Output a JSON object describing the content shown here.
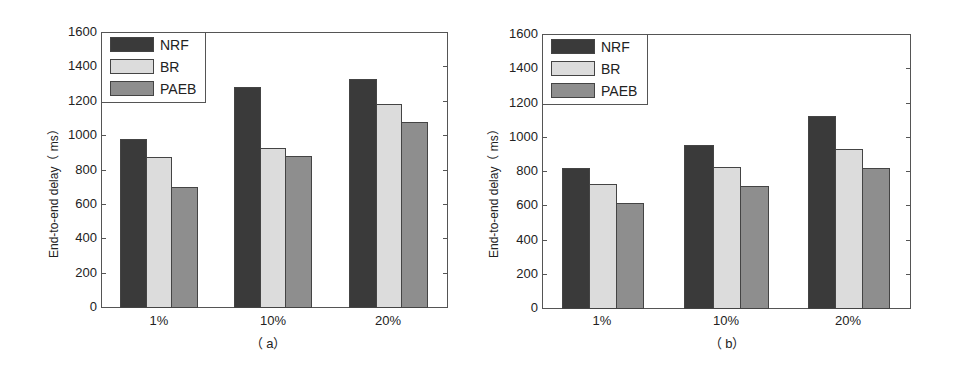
{
  "chart_data": [
    {
      "type": "bar",
      "title": "",
      "caption": "（ a）",
      "categories": [
        "1%",
        "10%",
        "20%"
      ],
      "xlabel": "",
      "ylabel": "End-to-end delay（ ms）",
      "ylim": [
        0,
        1600
      ],
      "yticks": [
        "0",
        "200",
        "400",
        "600",
        "800",
        "1000",
        "1200",
        "1400",
        "1600"
      ],
      "grid": false,
      "legend_position": "upper left",
      "series": [
        {
          "name": "NRF",
          "color": "#3a3a3a",
          "values": [
            980,
            1280,
            1325
          ]
        },
        {
          "name": "BR",
          "color": "#dcdcdc",
          "values": [
            870,
            925,
            1180
          ]
        },
        {
          "name": "PAEB",
          "color": "#8e8e8e",
          "values": [
            700,
            880,
            1075
          ]
        }
      ]
    },
    {
      "type": "bar",
      "title": "",
      "caption": "（ b）",
      "categories": [
        "1%",
        "10%",
        "20%"
      ],
      "xlabel": "",
      "ylabel": "End-to-end delay（ ms）",
      "ylim": [
        0,
        1600
      ],
      "yticks": [
        "0",
        "200",
        "400",
        "600",
        "800",
        "1000",
        "1200",
        "1400",
        "1600"
      ],
      "grid": false,
      "legend_position": "upper left",
      "series": [
        {
          "name": "NRF",
          "color": "#3a3a3a",
          "values": [
            815,
            950,
            1120
          ]
        },
        {
          "name": "BR",
          "color": "#dcdcdc",
          "values": [
            725,
            825,
            930
          ]
        },
        {
          "name": "PAEB",
          "color": "#8e8e8e",
          "values": [
            615,
            715,
            815
          ]
        }
      ]
    }
  ]
}
